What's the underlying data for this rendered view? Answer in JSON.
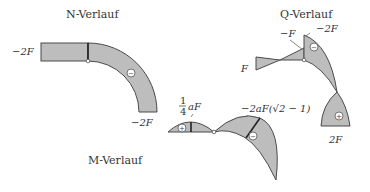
{
  "diagrams": {
    "n": {
      "title": "N-Verlauf",
      "labels": {
        "left": "−2F",
        "bottom": "−2F"
      },
      "sign": "−"
    },
    "q": {
      "title": "Q-Verlauf",
      "labels": {
        "left": "F",
        "top_left": "−F",
        "top_right": "−2F",
        "bottom": "2F"
      },
      "signs": {
        "upper": "−",
        "lower": "+"
      }
    },
    "m": {
      "title": "M-Verlauf",
      "labels": {
        "frac_num": "1",
        "frac_den": "4",
        "left_value": "aF",
        "right_value": "−2aF(√2 − 1)"
      },
      "signs": {
        "left": "+",
        "right": "−"
      }
    }
  },
  "colors": {
    "fill": "#bdbdbd",
    "stroke": "#4a4a4a"
  }
}
